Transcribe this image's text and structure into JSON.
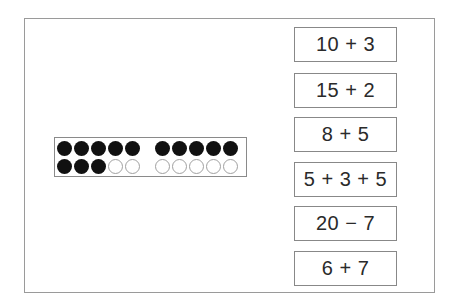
{
  "tenframe": {
    "total": 13,
    "rows": [
      [
        1,
        1,
        1,
        1,
        1,
        1,
        1,
        1,
        1,
        1
      ],
      [
        1,
        1,
        1,
        0,
        0,
        0,
        0,
        0,
        0,
        0
      ]
    ]
  },
  "cards": [
    {
      "label": "10 + 3"
    },
    {
      "label": "15 + 2"
    },
    {
      "label": "8 + 5"
    },
    {
      "label": "5 + 3 + 5"
    },
    {
      "label": "20 − 7"
    },
    {
      "label": "6 + 7"
    }
  ]
}
